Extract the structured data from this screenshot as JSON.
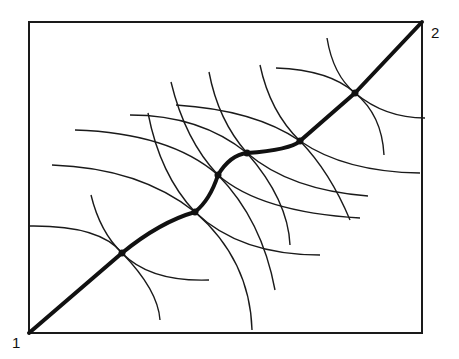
{
  "diagram": {
    "labels": {
      "start": "1",
      "end": "2"
    },
    "colors": {
      "line": "#1a1a1a",
      "background": "#ffffff"
    },
    "frame": {
      "x": 29,
      "y": 22,
      "w": 393,
      "h": 311
    },
    "path_nodes": [
      [
        29,
        333
      ],
      [
        122,
        253
      ],
      [
        195,
        212
      ],
      [
        218,
        175
      ],
      [
        247,
        153
      ],
      [
        300,
        141
      ],
      [
        355,
        93
      ],
      [
        422,
        22
      ]
    ]
  }
}
